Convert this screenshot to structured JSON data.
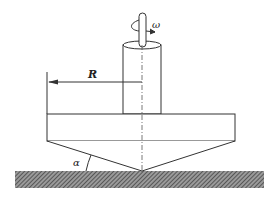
{
  "diagram": {
    "labels": {
      "radius": "R",
      "angular_velocity": "ω",
      "cone_angle": "α"
    },
    "colors": {
      "line": "#333333",
      "hatch": "#555555",
      "background": "#ffffff"
    }
  }
}
